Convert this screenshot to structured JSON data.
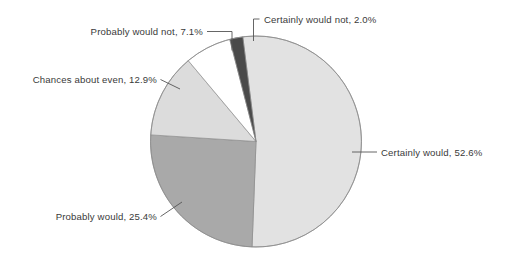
{
  "chart_data": {
    "type": "pie",
    "title": "",
    "subtitle": "",
    "xlabel": "",
    "ylabel": "",
    "legend_position": "none",
    "grid": false,
    "labels_outside": true,
    "start_angle_deg": -7.2,
    "direction": "clockwise",
    "categories": [
      "Certainly would",
      "Probably would",
      "Chances about even",
      "Probably would not",
      "Certainly would not"
    ],
    "values": [
      52.6,
      25.4,
      12.9,
      7.1,
      2.0
    ],
    "units": "%",
    "slices": [
      {
        "name": "certainly-would",
        "label": "Certainly would, 52.6%",
        "category": "Certainly would",
        "value": 52.6,
        "color": "#E2E2E2",
        "angle_deg": 189.4
      },
      {
        "name": "probably-would",
        "label": "Probably would, 25.4%",
        "category": "Probably would",
        "value": 25.4,
        "color": "#A9A9A9",
        "angle_deg": 91.4
      },
      {
        "name": "chances-about-even",
        "label": "Chances about even, 12.9%",
        "category": "Chances about even",
        "value": 12.9,
        "color": "#DCDCDC",
        "angle_deg": 46.4
      },
      {
        "name": "probably-would-not",
        "label": "Probably would not, 7.1%",
        "category": "Probably would not",
        "value": 7.1,
        "color": "#FFFFFF",
        "angle_deg": 25.6
      },
      {
        "name": "certainly-would-not",
        "label": "Certainly would not, 2.0%",
        "category": "Certainly would not",
        "value": 2.0,
        "color": "#4A4A4A",
        "angle_deg": 7.2
      }
    ]
  },
  "labels": {
    "certainly_would_not": "Certainly would not, 2.0%",
    "probably_would_not": "Probably would not, 7.1%",
    "chances_about_even": "Chances about even, 12.9%",
    "probably_would": "Probably would, 25.4%",
    "certainly_would": "Certainly would, 52.6%"
  },
  "colors": {
    "certainly_would": "#E2E2E2",
    "probably_would": "#A9A9A9",
    "chances_about_even": "#DCDCDC",
    "probably_would_not": "#FFFFFF",
    "certainly_would_not": "#4A4A4A",
    "outline": "#8C8C8C",
    "text": "#3A3A3A",
    "leader": "#555555",
    "background": "#FFFFFF"
  }
}
